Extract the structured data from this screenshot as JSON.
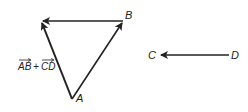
{
  "diagram": {
    "type": "vector-addition",
    "points": {
      "A": {
        "label": "A",
        "x": 72,
        "y": 99
      },
      "B": {
        "label": "B",
        "x": 123,
        "y": 21
      },
      "C": {
        "label": "C",
        "x": 160,
        "y": 55
      },
      "D": {
        "label": "D",
        "x": 229,
        "y": 55
      },
      "S": {
        "x": 41,
        "y": 21
      }
    },
    "vectors": [
      {
        "name": "AB",
        "from": "A",
        "to": "B"
      },
      {
        "name": "BS",
        "from": "B",
        "to": "S"
      },
      {
        "name": "AS",
        "from": "A",
        "to": "S",
        "label": "AB + CD"
      },
      {
        "name": "DC",
        "from": "D",
        "to": "C"
      }
    ],
    "sum_label": {
      "ab": "AB",
      "plus": "+",
      "cd": "CD"
    },
    "stroke_color": "#222222"
  }
}
